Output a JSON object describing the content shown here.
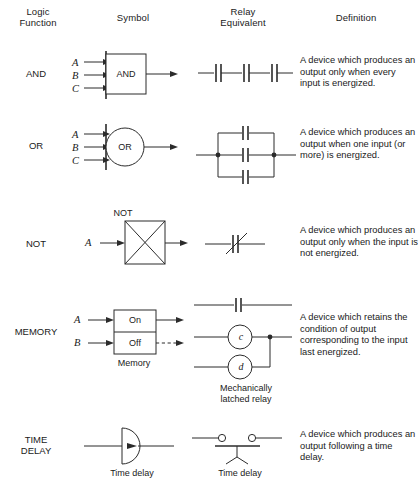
{
  "headers": {
    "logic_function": "Logic\nFunction",
    "logic_function_line1": "Logic",
    "logic_function_line2": "Function",
    "symbol": "Symbol",
    "relay_equivalent_line1": "Relay",
    "relay_equivalent_line2": "Equivalent",
    "definition": "Definition"
  },
  "rows": [
    {
      "id": "and",
      "label": "AND",
      "symbol": {
        "kind": "rectangle-gate",
        "text": "AND",
        "inputs": [
          "A",
          "B",
          "C"
        ],
        "output_style": "solid-arrow",
        "caption": ""
      },
      "relay": {
        "kind": "series-contacts",
        "contact_count": 3,
        "caption": ""
      },
      "definition": "A device which produces an output only when every input is energized."
    },
    {
      "id": "or",
      "label": "OR",
      "symbol": {
        "kind": "circle-gate",
        "text": "OR",
        "inputs": [
          "A",
          "B",
          "C"
        ],
        "output_style": "solid-arrow",
        "caption": ""
      },
      "relay": {
        "kind": "parallel-contacts",
        "contact_count": 3,
        "caption": ""
      },
      "definition": "A device which produces an output when one input (or more) is energized."
    },
    {
      "id": "not",
      "label": "NOT",
      "symbol": {
        "kind": "crossed-box-gate",
        "text": "NOT",
        "inputs": [
          "A"
        ],
        "output_style": "solid-arrow",
        "caption": ""
      },
      "relay": {
        "kind": "normally-closed-contact",
        "contact_count": 1,
        "caption": ""
      },
      "definition": "A device which produces an output only when the input is not energized."
    },
    {
      "id": "memory",
      "label": "MEMORY",
      "symbol": {
        "kind": "memory-box",
        "cells": [
          "On",
          "Off"
        ],
        "inputs": [
          "A",
          "B"
        ],
        "output_style": "solid-and-dashed-arrow",
        "caption": "Memory"
      },
      "relay": {
        "kind": "latched-relay",
        "coils": [
          "c",
          "d"
        ],
        "caption_line1": "Mechanically",
        "caption_line2": "latched relay"
      },
      "definition": "A device which retains the condition of output corresponding to the input last energized."
    },
    {
      "id": "time-delay",
      "label": "TIME\nDELAY",
      "label_line1": "TIME",
      "label_line2": "DELAY",
      "symbol": {
        "kind": "semicircle-delay",
        "inputs": [],
        "output_style": "plain-line",
        "caption": "Time delay"
      },
      "relay": {
        "kind": "timed-contact",
        "caption": "Time delay"
      },
      "definition": "A device which produces an output following a time delay."
    }
  ],
  "colors": {
    "ink": "#2b2b2b",
    "text": "#1a1a1a",
    "background": "#ffffff"
  }
}
